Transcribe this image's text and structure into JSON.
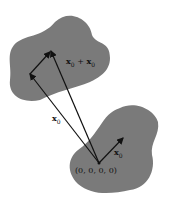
{
  "figure": {
    "blob_color": "#7a7a7a",
    "arrow_color": "#111111",
    "labels": {
      "sum": {
        "base": "x",
        "sub1": "0",
        "op": " + ",
        "base2": "x",
        "sub2": "0"
      },
      "left": {
        "base": "x",
        "sub": "0"
      },
      "right": {
        "base": "x",
        "sub": "0"
      },
      "origin": "(0, 0, 0, 0)"
    }
  }
}
